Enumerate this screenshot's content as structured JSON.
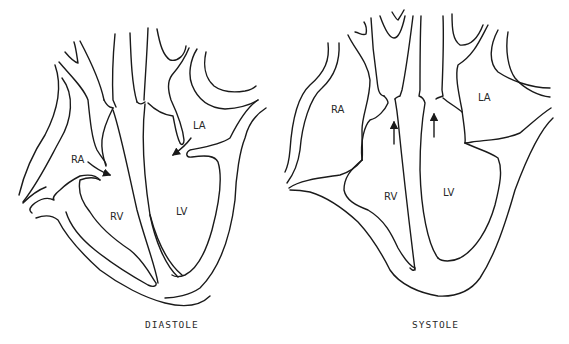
{
  "diagrams": [
    {
      "caption": "DIASTOLE",
      "labels": {
        "ra": "RA",
        "la": "LA",
        "rv": "RV",
        "lv": "LV"
      },
      "arrows": [
        "RA to RV (tricuspid inflow)",
        "LA to LV (mitral inflow)"
      ]
    },
    {
      "caption": "SYSTOLE",
      "labels": {
        "ra": "RA",
        "la": "LA",
        "rv": "RV",
        "lv": "LV"
      },
      "arrows": [
        "RV outflow up (pulmonary)",
        "LV outflow up (aortic)"
      ]
    }
  ],
  "colors": {
    "line": "#1a1a1a",
    "background": "#ffffff"
  }
}
